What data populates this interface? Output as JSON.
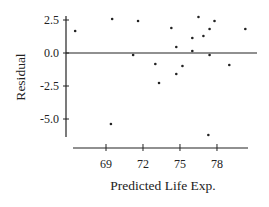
{
  "chart_data": {
    "type": "scatter",
    "title": "",
    "xlabel": "Predicted Life Exp.",
    "ylabel": "Residual",
    "x_ticks": [
      69,
      72,
      75,
      78
    ],
    "x_tick_labels": [
      "69",
      "72",
      "75",
      "78"
    ],
    "y_ticks": [
      2.5,
      0.0,
      -2.5,
      -5.0
    ],
    "y_tick_labels": [
      "2.5",
      "0.0",
      "-2.5",
      "-5.0"
    ],
    "xlim": [
      66.3,
      81.2
    ],
    "ylim": [
      -6.3,
      2.8
    ],
    "grid": false,
    "reference_line": {
      "y": 0.0
    },
    "points": [
      {
        "x": 66.5,
        "y": 1.67
      },
      {
        "x": 69.5,
        "y": 2.58
      },
      {
        "x": 71.6,
        "y": 2.42
      },
      {
        "x": 71.2,
        "y": -0.15
      },
      {
        "x": 74.3,
        "y": 1.89
      },
      {
        "x": 76.5,
        "y": 2.73
      },
      {
        "x": 77.8,
        "y": 2.42
      },
      {
        "x": 77.4,
        "y": 1.82
      },
      {
        "x": 76.9,
        "y": 1.29
      },
      {
        "x": 76.0,
        "y": 1.14
      },
      {
        "x": 74.7,
        "y": 0.45
      },
      {
        "x": 76.0,
        "y": 0.15
      },
      {
        "x": 77.4,
        "y": -0.15
      },
      {
        "x": 80.3,
        "y": 1.82
      },
      {
        "x": 73.0,
        "y": -0.83
      },
      {
        "x": 75.2,
        "y": -0.98
      },
      {
        "x": 74.7,
        "y": -1.59
      },
      {
        "x": 73.3,
        "y": -2.27
      },
      {
        "x": 79.0,
        "y": -0.91
      },
      {
        "x": 69.4,
        "y": -5.38
      },
      {
        "x": 77.3,
        "y": -6.21
      }
    ]
  },
  "colors": {
    "ink": "#222222",
    "background": "#ffffff"
  }
}
